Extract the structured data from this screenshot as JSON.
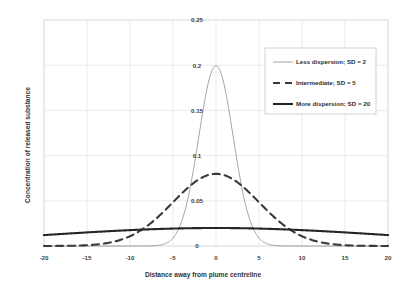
{
  "chart_data": {
    "type": "line",
    "title": "",
    "xlabel": "Distance away from plume centreline",
    "ylabel": "Concentration of released substance",
    "xlim": [
      -20,
      20
    ],
    "ylim": [
      0,
      0.25
    ],
    "xticks": [
      -20,
      -15,
      -10,
      -5,
      0,
      5,
      10,
      15,
      20
    ],
    "xtick_labels": [
      "-20",
      "-15",
      "-10",
      "-5",
      "0",
      "5",
      "10",
      "15",
      "20"
    ],
    "yticks": [
      0,
      0.05,
      0.1,
      0.15,
      0.2,
      0.25
    ],
    "ytick_labels": [
      "0",
      "0.05",
      "0.1",
      "0.15",
      "0.2",
      "0.25"
    ],
    "grid": true,
    "legend_position": "upper right",
    "series": [
      {
        "name": "Less dispersion; SD = 2",
        "sd": 2,
        "peak_value": 0.1995,
        "color": "#808080",
        "width": 0.7,
        "dash": "none",
        "x": [
          -20,
          -18,
          -16,
          -14,
          -12,
          -10,
          -9,
          -8,
          -7,
          -6,
          -5.5,
          -5,
          -4.5,
          -4,
          -3.5,
          -3,
          -2.5,
          -2,
          -1.5,
          -1,
          -0.5,
          0,
          0.5,
          1,
          1.5,
          2,
          2.5,
          3,
          3.5,
          4,
          4.5,
          5,
          5.5,
          6,
          7,
          8,
          9,
          10,
          12,
          14,
          16,
          18,
          20
        ],
        "y": [
          0,
          0,
          0,
          0,
          0,
          0.0001,
          0.0003,
          0.0007,
          0.0022,
          0.0065,
          0.0108,
          0.0175,
          0.027,
          0.0403,
          0.0579,
          0.0806,
          0.108,
          0.121,
          0.1587,
          0.176,
          0.1933,
          0.1995,
          0.1933,
          0.176,
          0.1587,
          0.121,
          0.108,
          0.0806,
          0.0579,
          0.0403,
          0.027,
          0.0175,
          0.0108,
          0.0065,
          0.0022,
          0.0007,
          0.0003,
          0.0001,
          0,
          0,
          0,
          0,
          0
        ]
      },
      {
        "name": "Intermediate; SD = 5",
        "sd": 5,
        "peak_value": 0.0798,
        "color": "#3a3a3a",
        "width": 2.1,
        "dash": "dashed",
        "x": [
          -20,
          -18,
          -16,
          -15,
          -14,
          -12,
          -10,
          -9,
          -8,
          -7,
          -6,
          -5,
          -4,
          -3,
          -2,
          -1,
          0,
          1,
          2,
          3,
          4,
          5,
          6,
          7,
          8,
          9,
          10,
          12,
          14,
          15,
          16,
          18,
          20
        ],
        "y": [
          0.0002,
          0.0008,
          0.0022,
          0.0035,
          0.0054,
          0.0111,
          0.0108,
          0.0158,
          0.0222,
          0.0298,
          0.0382,
          0.0484,
          0.0579,
          0.0666,
          0.0736,
          0.0782,
          0.0798,
          0.0782,
          0.0736,
          0.0666,
          0.0579,
          0.0484,
          0.0382,
          0.0298,
          0.0222,
          0.0158,
          0.0108,
          0.0111,
          0.0054,
          0.0035,
          0.0022,
          0.0008,
          0.0002
        ]
      },
      {
        "name": "More dispersion; SD = 20",
        "sd": 20,
        "peak_value": 0.0199,
        "color": "#262626",
        "width": 2.1,
        "dash": "none",
        "x": [
          -20,
          -18,
          -16,
          -14,
          -12,
          -10,
          -8,
          -6,
          -4,
          -2,
          0,
          2,
          4,
          6,
          8,
          10,
          12,
          14,
          16,
          18,
          20
        ],
        "y": [
          0.0121,
          0.0136,
          0.015,
          0.0162,
          0.0173,
          0.0176,
          0.0185,
          0.0191,
          0.0195,
          0.0198,
          0.0199,
          0.0198,
          0.0195,
          0.0191,
          0.0185,
          0.0176,
          0.0173,
          0.0162,
          0.015,
          0.0136,
          0.0121
        ]
      }
    ]
  },
  "legend": {
    "entries": [
      {
        "label": "Less dispersion; SD = 2"
      },
      {
        "label": "Intermediate; SD = 5"
      },
      {
        "label": "More dispersion; SD = 20"
      }
    ]
  }
}
